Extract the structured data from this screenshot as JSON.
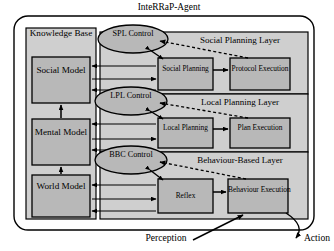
{
  "title": "InteRRaP-Agent",
  "knowledge_base": {
    "label": "Knowledge Base",
    "models": [
      {
        "name": "social-model",
        "label": "Social Model"
      },
      {
        "name": "mental-model",
        "label": "Mental Model"
      },
      {
        "name": "world-model",
        "label": "World Model"
      }
    ]
  },
  "controls": [
    {
      "name": "spl-control",
      "label": "SPL Control"
    },
    {
      "name": "lpl-control",
      "label": "LPL Control"
    },
    {
      "name": "bbc-control",
      "label": "BBC Control"
    }
  ],
  "layers": [
    {
      "name": "social-planning-layer",
      "label": "Social Planning Layer",
      "boxes": [
        {
          "name": "social-planning",
          "label": "Social Planning"
        },
        {
          "name": "protocol-execution",
          "label": "Protocol Execution"
        }
      ]
    },
    {
      "name": "local-planning-layer",
      "label": "Local Planning Layer",
      "boxes": [
        {
          "name": "local-planning",
          "label": "Local Planning"
        },
        {
          "name": "plan-execution",
          "label": "Plan Execution"
        }
      ]
    },
    {
      "name": "behaviour-based-layer",
      "label": "Behaviour-Based Layer",
      "boxes": [
        {
          "name": "reflex",
          "label": "Reflex"
        },
        {
          "name": "behaviour-execution",
          "label": "Behaviour Execution"
        }
      ]
    }
  ],
  "io": {
    "perception": "Perception",
    "action": "Action"
  },
  "colors": {
    "fill_gray": "#b8b8b8",
    "panel_gray": "#cfcfcf",
    "outline": "#000000",
    "background": "#ffffff"
  }
}
